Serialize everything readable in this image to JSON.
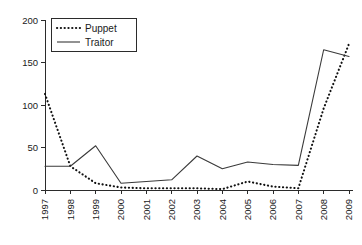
{
  "chart_data": {
    "type": "line",
    "title": "",
    "xlabel": "",
    "ylabel": "",
    "grid": false,
    "legend_position": "top-left",
    "categories": [
      "1997",
      "1998",
      "1999",
      "2000",
      "2001",
      "2002",
      "2003",
      "2004",
      "2005",
      "2006",
      "2007",
      "2008",
      "2009"
    ],
    "x": [
      1997,
      1998,
      1999,
      2000,
      2001,
      2002,
      2003,
      2004,
      2005,
      2006,
      2007,
      2008,
      2009
    ],
    "ylim": [
      0,
      200
    ],
    "xlim": [
      1997,
      2009
    ],
    "yticks": [
      0,
      50,
      100,
      150,
      200
    ],
    "ytick_labels": [
      "0",
      "50",
      "100",
      "150",
      "200"
    ],
    "series": [
      {
        "name": "Puppet",
        "style": "dotted",
        "color": "#111111",
        "values": [
          113,
          28,
          8,
          3,
          2,
          2,
          2,
          1,
          10,
          4,
          2,
          96,
          172
        ]
      },
      {
        "name": "Traitor",
        "style": "solid",
        "color": "#3a3a3a",
        "values": [
          28,
          28,
          52,
          8,
          10,
          12,
          40,
          25,
          33,
          30,
          29,
          165,
          157
        ]
      }
    ]
  },
  "legend": {
    "entries": [
      {
        "label": "Puppet",
        "style": "dotted"
      },
      {
        "label": "Traitor",
        "style": "solid"
      }
    ]
  },
  "axes": {
    "y_tick_labels": [
      "200",
      "150",
      "100",
      "50",
      "0"
    ],
    "x_tick_labels": [
      "1997",
      "1998",
      "1999",
      "2000",
      "2001",
      "2002",
      "2003",
      "2004",
      "2005",
      "2006",
      "2007",
      "2008",
      "2009"
    ]
  }
}
